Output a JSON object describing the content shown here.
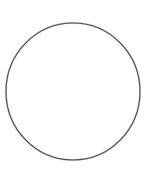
{
  "image": {
    "kind": "line-drawing",
    "subject": "circle-outline",
    "description": "Thin dark outline of a circle (ring / hoop) centered on a plain white background",
    "width": 159,
    "height": 174,
    "background_color": "#ffffff",
    "text_content": "",
    "labels": []
  },
  "shapes": [
    {
      "name": "circle-outline",
      "type": "ellipse",
      "center_x": 73,
      "center_y": 91.5,
      "radius_x": 67,
      "radius_y": 68.5,
      "stroke_color": "#3f3f42",
      "stroke_width": 1.1,
      "fill_color": "#ffffff",
      "opacity": 0.92
    },
    {
      "name": "circle-outline-soft-edge",
      "type": "ellipse",
      "center_x": 73,
      "center_y": 91.5,
      "radius_x": 67,
      "radius_y": 68.5,
      "stroke_color": "#6b6b70",
      "stroke_width": 2.0,
      "fill_color": "none",
      "opacity": 0.28
    }
  ]
}
